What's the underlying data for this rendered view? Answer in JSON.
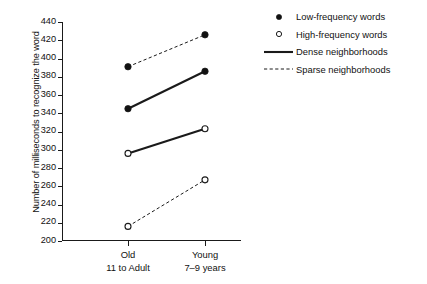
{
  "chart_data": {
    "type": "line",
    "title": "",
    "xlabel": "",
    "ylabel": "Number of milliseconds to recognize the word",
    "categories": [
      "Old",
      "Young"
    ],
    "category_sublabels": [
      "11 to Adult",
      "7–9 years"
    ],
    "ylim": [
      200,
      440
    ],
    "yticks": [
      200,
      220,
      240,
      260,
      280,
      300,
      320,
      340,
      360,
      380,
      400,
      420,
      440
    ],
    "grid": false,
    "legend_position": "right",
    "series": [
      {
        "name": "Low-frequency words, Sparse neighborhoods",
        "marker": "filled-circle",
        "line": "dashed",
        "values": [
          391,
          426
        ]
      },
      {
        "name": "Low-frequency words, Dense neighborhoods",
        "marker": "filled-circle",
        "line": "solid",
        "values": [
          345,
          386
        ]
      },
      {
        "name": "High-frequency words, Dense neighborhoods",
        "marker": "open-circle",
        "line": "solid",
        "values": [
          296,
          323
        ]
      },
      {
        "name": "High-frequency words, Sparse neighborhoods",
        "marker": "open-circle",
        "line": "dashed",
        "values": [
          216,
          267
        ]
      }
    ],
    "legend": [
      {
        "label": "Low-frequency words",
        "marker": "filled-circle"
      },
      {
        "label": "High-frequency words",
        "marker": "open-circle"
      },
      {
        "label": "Dense neighborhoods",
        "marker": "solid-line"
      },
      {
        "label": "Sparse neighborhoods",
        "marker": "dashed-line"
      }
    ],
    "colors": {
      "line": "#1a1a1a",
      "marker_fill": "#111111",
      "marker_open_fill": "#ffffff",
      "axis": "#1a1a1a",
      "background": "#ffffff"
    }
  }
}
